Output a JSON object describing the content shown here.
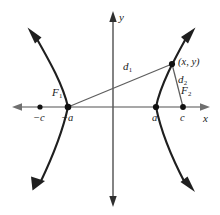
{
  "figure": {
    "type": "hyperbola-diagram",
    "colors": {
      "curve": "#1a1a1a",
      "x_axis": "#8a8a8a",
      "y_axis": "#4a4a4a",
      "segment": "#5a5a5a",
      "point": "#111111",
      "label": "#1a1a1a",
      "background": "#ffffff"
    }
  },
  "axes": {
    "x_label": "x",
    "y_label": "y",
    "x_axis": {
      "y": 107,
      "x_start": 12,
      "x_end": 210,
      "arrows": "both"
    },
    "y_axis": {
      "x": 113,
      "y_start": 12,
      "y_end": 207,
      "arrows": "both"
    }
  },
  "points": [
    {
      "name": "minus-c",
      "label": "−c",
      "x": 40,
      "y": 107,
      "dot": true
    },
    {
      "name": "minus-a",
      "label": "−a",
      "x": 68,
      "y": 107,
      "dot": true
    },
    {
      "name": "a",
      "label": "a",
      "x": 156,
      "y": 107,
      "dot": true
    },
    {
      "name": "c",
      "label": "c",
      "x": 183,
      "y": 107,
      "dot": true
    },
    {
      "name": "xy-point",
      "label": "(x, y)",
      "x": 172,
      "y": 64,
      "dot": true
    }
  ],
  "foci": [
    {
      "name": "focus-1",
      "label": "F",
      "sub": "1",
      "x": 68,
      "y": 107
    },
    {
      "name": "focus-2",
      "label": "F",
      "sub": "2",
      "x": 183,
      "y": 107
    }
  ],
  "segments": [
    {
      "name": "d1",
      "label": "d",
      "sub": "1",
      "from": [
        68,
        107
      ],
      "to": [
        172,
        64
      ]
    },
    {
      "name": "d2",
      "label": "d",
      "sub": "2",
      "from": [
        183,
        107
      ],
      "to": [
        172,
        64
      ]
    }
  ],
  "branches": [
    {
      "name": "left-branch",
      "vertex": [
        68,
        107
      ],
      "opens": "left",
      "upper_tip": [
        28,
        28
      ],
      "lower_tip": [
        33,
        190
      ]
    },
    {
      "name": "right-branch",
      "vertex": [
        156,
        107
      ],
      "opens": "right",
      "upper_tip": [
        195,
        28
      ],
      "lower_tip": [
        195,
        192
      ]
    }
  ],
  "label_positions": {
    "y_axis_label": {
      "x": 119,
      "y": 12
    },
    "x_axis_label": {
      "x": 203,
      "y": 113
    },
    "minus_c": {
      "x": 33,
      "y": 113
    },
    "minus_a": {
      "x": 62,
      "y": 113
    },
    "a": {
      "x": 152,
      "y": 113
    },
    "c": {
      "x": 180,
      "y": 113
    },
    "focus_1": {
      "x": 52,
      "y": 88
    },
    "focus_2": {
      "x": 182,
      "y": 86
    },
    "d1": {
      "x": 123,
      "y": 62
    },
    "d2": {
      "x": 178,
      "y": 75
    },
    "xy": {
      "x": 178,
      "y": 58
    }
  }
}
